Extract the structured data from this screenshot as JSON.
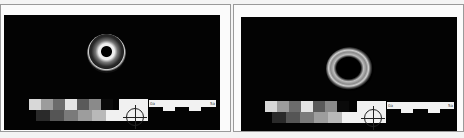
{
  "panels": [
    {
      "id": "left",
      "subject": "ring-shaped specimen with dark center hole and bright outer rim",
      "ruler": {
        "start_label": "0a",
        "end_label": "5a"
      },
      "swatch_row_top": [
        "#d8d8d8",
        "#9c9c9c",
        "#6c6c6c",
        "#e4e4e4",
        "#5a5a5a",
        "#8a8a8a",
        "#0a0a0a"
      ],
      "swatch_row_bottom": [
        "#2a2a2a",
        "#555555",
        "#7a7a7a",
        "#9d9d9d",
        "#b9b9b9",
        "#d6d6d6"
      ]
    },
    {
      "id": "right",
      "subject": "rough textured ring-shaped specimen with large dark center",
      "ruler": {
        "start_label": "0a",
        "end_label": "5a"
      },
      "swatch_row_top": [
        "#d8d8d8",
        "#9c9c9c",
        "#6c6c6c",
        "#e4e4e4",
        "#5a5a5a",
        "#8a8a8a",
        "#0a0a0a"
      ],
      "swatch_row_bottom": [
        "#2a2a2a",
        "#555555",
        "#7a7a7a",
        "#9d9d9d",
        "#b9b9b9",
        "#d6d6d6"
      ]
    }
  ]
}
